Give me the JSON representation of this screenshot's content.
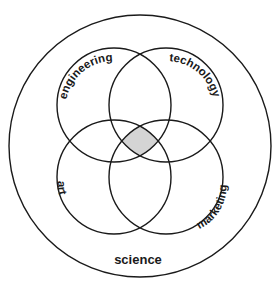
{
  "diagram": {
    "type": "venn",
    "outer_set": {
      "label": "science"
    },
    "inner_sets": [
      {
        "id": "engineering",
        "label": "engineering",
        "position": "top-left"
      },
      {
        "id": "technology",
        "label": "technology",
        "position": "top-right"
      },
      {
        "id": "art",
        "label": "art",
        "position": "bottom-left"
      },
      {
        "id": "marketing",
        "label": "marketing",
        "position": "bottom-right"
      }
    ],
    "highlight": {
      "region": "intersection of all four inner sets",
      "color": "#d4d4d4"
    },
    "colors": {
      "stroke": "#1a1a1a",
      "background": "#ffffff"
    }
  }
}
